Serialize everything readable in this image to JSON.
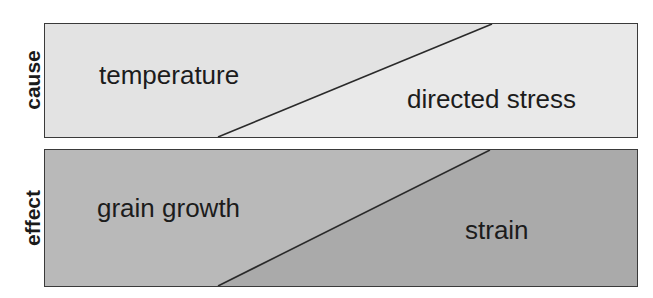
{
  "rows": [
    {
      "label": "cause",
      "left_region": "temperature",
      "right_region": "directed stress",
      "colors": {
        "left": "#e4e4e4",
        "right": "#e8e8e8",
        "line": "#2a2a2a"
      }
    },
    {
      "label": "effect",
      "left_region": "grain growth",
      "right_region": "strain",
      "colors": {
        "left": "#b9b9b9",
        "right": "#a9a9a9",
        "line": "#2a2a2a"
      }
    }
  ]
}
